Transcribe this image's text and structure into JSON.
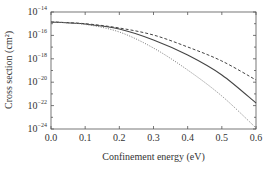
{
  "chart_data": {
    "type": "line",
    "title": "",
    "xlabel": "Confinement energy (eV)",
    "ylabel": "Cross section (cm²)",
    "xlim": [
      0.0,
      0.6
    ],
    "ylim_log10": [
      -24,
      -14
    ],
    "yscale": "log",
    "grid": false,
    "legend": null,
    "x_ticks": [
      "0.0",
      "0.1",
      "0.2",
      "0.3",
      "0.4",
      "0.5",
      "0.6"
    ],
    "y_ticks": [
      {
        "base": "10",
        "exp": "−14",
        "log10": -14
      },
      {
        "base": "10",
        "exp": "−16",
        "log10": -16
      },
      {
        "base": "10",
        "exp": "−18",
        "log10": -18
      },
      {
        "base": "10",
        "exp": "−20",
        "log10": -20
      },
      {
        "base": "10",
        "exp": "−22",
        "log10": -22
      },
      {
        "base": "10",
        "exp": "−24",
        "log10": -24
      }
    ],
    "x": [
      0.0,
      0.1,
      0.2,
      0.3,
      0.4,
      0.5,
      0.6
    ],
    "series": [
      {
        "name": "dashed",
        "style": "dashed",
        "log10_values": [
          -14.85,
          -15.0,
          -15.37,
          -15.97,
          -16.99,
          -18.19,
          -19.81
        ]
      },
      {
        "name": "solid",
        "style": "solid",
        "log10_values": [
          -14.85,
          -15.03,
          -15.45,
          -16.39,
          -17.68,
          -19.38,
          -21.78
        ]
      },
      {
        "name": "dotted",
        "style": "dotted",
        "log10_values": [
          -14.85,
          -15.06,
          -15.71,
          -17.08,
          -18.96,
          -21.18,
          -23.91
        ]
      }
    ]
  },
  "colors": {
    "axis": "#555555",
    "line": "#444444",
    "dotted": "#777777"
  }
}
